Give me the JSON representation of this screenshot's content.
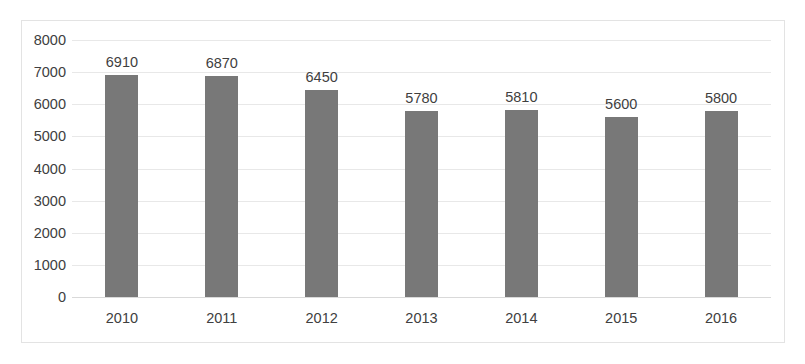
{
  "chart_data": {
    "type": "bar",
    "title": "",
    "xlabel": "",
    "ylabel": "",
    "categories": [
      "2010",
      "2011",
      "2012",
      "2013",
      "2014",
      "2015",
      "2016"
    ],
    "values": [
      6910,
      6870,
      6450,
      5780,
      5810,
      5600,
      5800
    ],
    "data_labels": [
      "6910",
      "6870",
      "6450",
      "5780",
      "5810",
      "5600",
      "5800"
    ],
    "ylim": [
      0,
      8000
    ],
    "ytick_labels": [
      "8000",
      "7000",
      "6000",
      "5000",
      "4000",
      "3000",
      "2000",
      "1000",
      "0"
    ],
    "ytick_values": [
      8000,
      7000,
      6000,
      5000,
      4000,
      3000,
      2000,
      1000,
      0
    ],
    "grid": true,
    "legend": null,
    "legend_position": "none",
    "series": [
      {
        "name": "",
        "values": [
          6910,
          6870,
          6450,
          5780,
          5810,
          5600,
          5800
        ],
        "color": "#787878"
      }
    ],
    "colors": {
      "bar": "#787878",
      "gridline": "#e8e8e8",
      "axis_line": "#d9d9d9",
      "border": "#e3e3e3",
      "text": "#404040",
      "background": "#ffffff"
    }
  }
}
